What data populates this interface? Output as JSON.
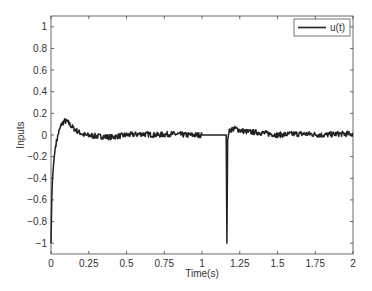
{
  "chart_data": {
    "type": "line",
    "title": "",
    "xlabel": "Time(s)",
    "ylabel": "Inputs",
    "xlim": [
      0,
      2
    ],
    "ylim": [
      -1.1,
      1.1
    ],
    "xticks": [
      0,
      0.25,
      0.5,
      0.75,
      1,
      1.25,
      1.5,
      1.75,
      2
    ],
    "xtick_labels": [
      "0",
      "0.25",
      "0.5",
      "0.75",
      "1",
      "1.25",
      "1.5",
      "1.75",
      "2"
    ],
    "yticks": [
      -1,
      -0.8,
      -0.6,
      -0.4,
      -0.2,
      0,
      0.2,
      0.4,
      0.6,
      0.8,
      1
    ],
    "ytick_labels": [
      "-1",
      "-0.8",
      "-0.6",
      "-0.4",
      "-0.2",
      "0",
      "0.2",
      "0.4",
      "0.6",
      "0.8",
      "1"
    ],
    "grid": false,
    "legend": {
      "position": "upper right",
      "entries": [
        "u(t)"
      ]
    },
    "series": [
      {
        "name": "u(t)",
        "color": "#222222",
        "x": [
          0,
          0.005,
          0.01,
          0.02,
          0.03,
          0.05,
          0.07,
          0.09,
          0.11,
          0.13,
          0.15,
          0.18,
          0.22,
          0.3,
          0.4,
          0.5,
          0.6,
          0.7,
          0.8,
          0.9,
          1.0,
          1.05,
          1.1,
          1.16,
          1.165,
          1.17,
          1.175,
          1.19,
          1.22,
          1.26,
          1.3,
          1.4,
          1.5,
          1.6,
          1.7,
          1.8,
          1.9,
          2.0
        ],
        "y": [
          -1,
          -0.6,
          -0.4,
          -0.22,
          -0.1,
          0.02,
          0.1,
          0.13,
          0.12,
          0.09,
          0.06,
          0.03,
          0.0,
          -0.01,
          -0.02,
          0.0,
          0.01,
          0.0,
          0.01,
          0.0,
          0.0,
          0.0,
          0.0,
          0.0,
          -1,
          -0.05,
          0.02,
          0.05,
          0.06,
          0.04,
          0.03,
          0.02,
          0.0,
          0.01,
          0.01,
          0.0,
          0.01,
          0.01
        ],
        "noise": "small high-frequency noise (~±0.02) on all non-flat segments; flat (noise-free) segment from t≈1.0 to t≈1.16"
      }
    ]
  },
  "ui": {
    "xlabel": "Time(s)",
    "ylabel": "Inputs",
    "legend_label": "u(t)"
  }
}
